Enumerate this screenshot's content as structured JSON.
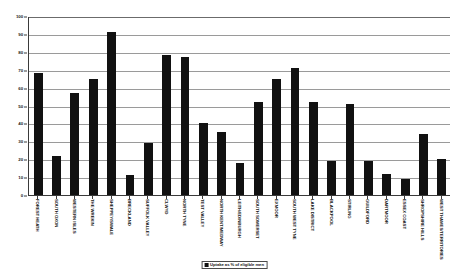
{
  "chart_data": {
    "type": "bar",
    "title": "",
    "subtitle": "",
    "xlabel": "",
    "ylabel": "",
    "ylim": [
      0,
      100
    ],
    "ytick_step": 10,
    "yticks": [
      "0",
      "10",
      "20",
      "30",
      "40",
      "50",
      "60",
      "70",
      "80",
      "90",
      "100"
    ],
    "grid": true,
    "legend_position": "bottom-center",
    "legend": [
      "Uptake as % of eligible men"
    ],
    "series_color": "#111111",
    "categories": [
      "FOREST HEATH",
      "SOUTH OXON",
      "WESTERN ISLES",
      "THE WREKIN",
      "SHEPPEY/SWALE",
      "BRECKLAND",
      "SUFFOLK VALLEY",
      "CLWYD",
      "NORTH TYNE",
      "TEST VALLEY",
      "NORTH KENT/MEDWAY",
      "LEITH/EDINBURGH",
      "SOUTH SOMERSET",
      "EXMOOR",
      "SOUTH WEST TYNE",
      "LAKE DISTRICT",
      "BLACKPOOL",
      "STIRLING",
      "GUILDFORD",
      "DARTMOOR",
      "ESSEX COAST",
      "SHROPSHIRE HILLS",
      "WEST THAMES/TERRITORIES"
    ],
    "values": [
      68,
      22,
      57,
      65,
      91,
      11,
      29,
      78,
      77,
      40,
      35,
      18,
      52,
      65,
      71,
      52,
      19,
      51,
      19,
      12,
      9,
      34,
      20
    ]
  }
}
